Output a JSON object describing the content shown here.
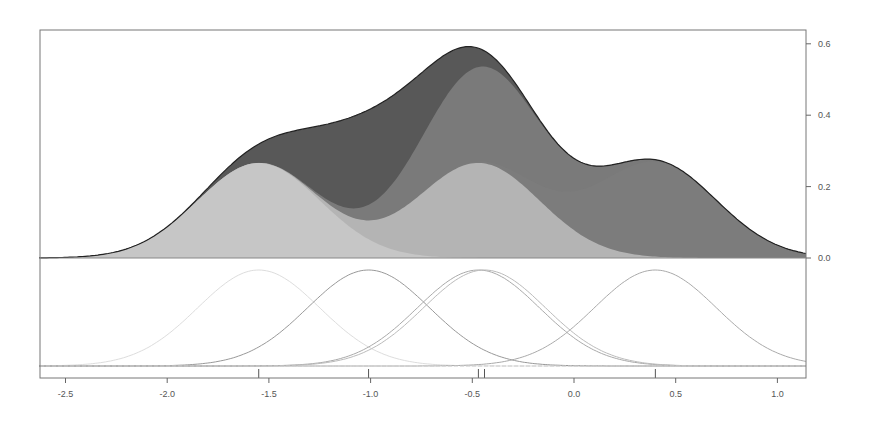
{
  "chart_data": {
    "type": "area",
    "title": "",
    "xlabel": "",
    "ylabel": "",
    "xlim": [
      -2.63,
      1.14
    ],
    "ylim": [
      0,
      0.64
    ],
    "x_ticks": [
      -2.5,
      -2.0,
      -1.5,
      -1.0,
      -0.5,
      0.0,
      0.5,
      1.0
    ],
    "x_tick_labels": [
      "-2.5",
      "-2.0",
      "-1.5",
      "-1.0",
      "-0.5",
      "0.0",
      "0.5",
      "1.0"
    ],
    "y_ticks": [
      0.0,
      0.2,
      0.4,
      0.6
    ],
    "y_tick_labels": [
      "0.0",
      "0.2",
      "0.4",
      "0.6"
    ],
    "y_axis_side": "right",
    "grid": false,
    "legend": null,
    "bandwidth": 0.3,
    "kernel_weight": 0.2,
    "data_points": [
      -1.55,
      -1.01,
      -0.47,
      -0.44,
      0.4
    ],
    "layers": [
      {
        "center": -1.55,
        "color": "#c6c6c6",
        "peak": 0.266
      },
      {
        "center": -0.47,
        "color": "#b4b4b4",
        "peak": 0.266
      },
      {
        "center": 0.4,
        "color": "#7c7c7c",
        "peak": 0.266
      },
      {
        "center": -0.44,
        "color": "#7a7a7a",
        "peak": 0.266
      },
      {
        "center": -1.01,
        "color": "#585858",
        "peak": 0.266
      }
    ],
    "total_density_peaks": [
      {
        "x": -1.55,
        "y": 0.32,
        "note": "shoulder"
      },
      {
        "x": -0.47,
        "y": 0.59
      },
      {
        "x": 0.4,
        "y": 0.28
      }
    ],
    "outline_color": "#222222",
    "kernel_line_colors": [
      "#dddddd",
      "#999999",
      "#aaaaaa",
      "#bbbbbb",
      "#aaaaaa"
    ]
  },
  "layout": {
    "plot_left": 40,
    "plot_right": 806,
    "top_panel": {
      "top": 30,
      "bottom": 258
    },
    "bottom_panel": {
      "top": 258,
      "bottom": 378
    },
    "x_px_per_unit": 203.4,
    "x_zero_px": 574,
    "y_px_per_unit": 357,
    "y_zero_px": 258
  }
}
